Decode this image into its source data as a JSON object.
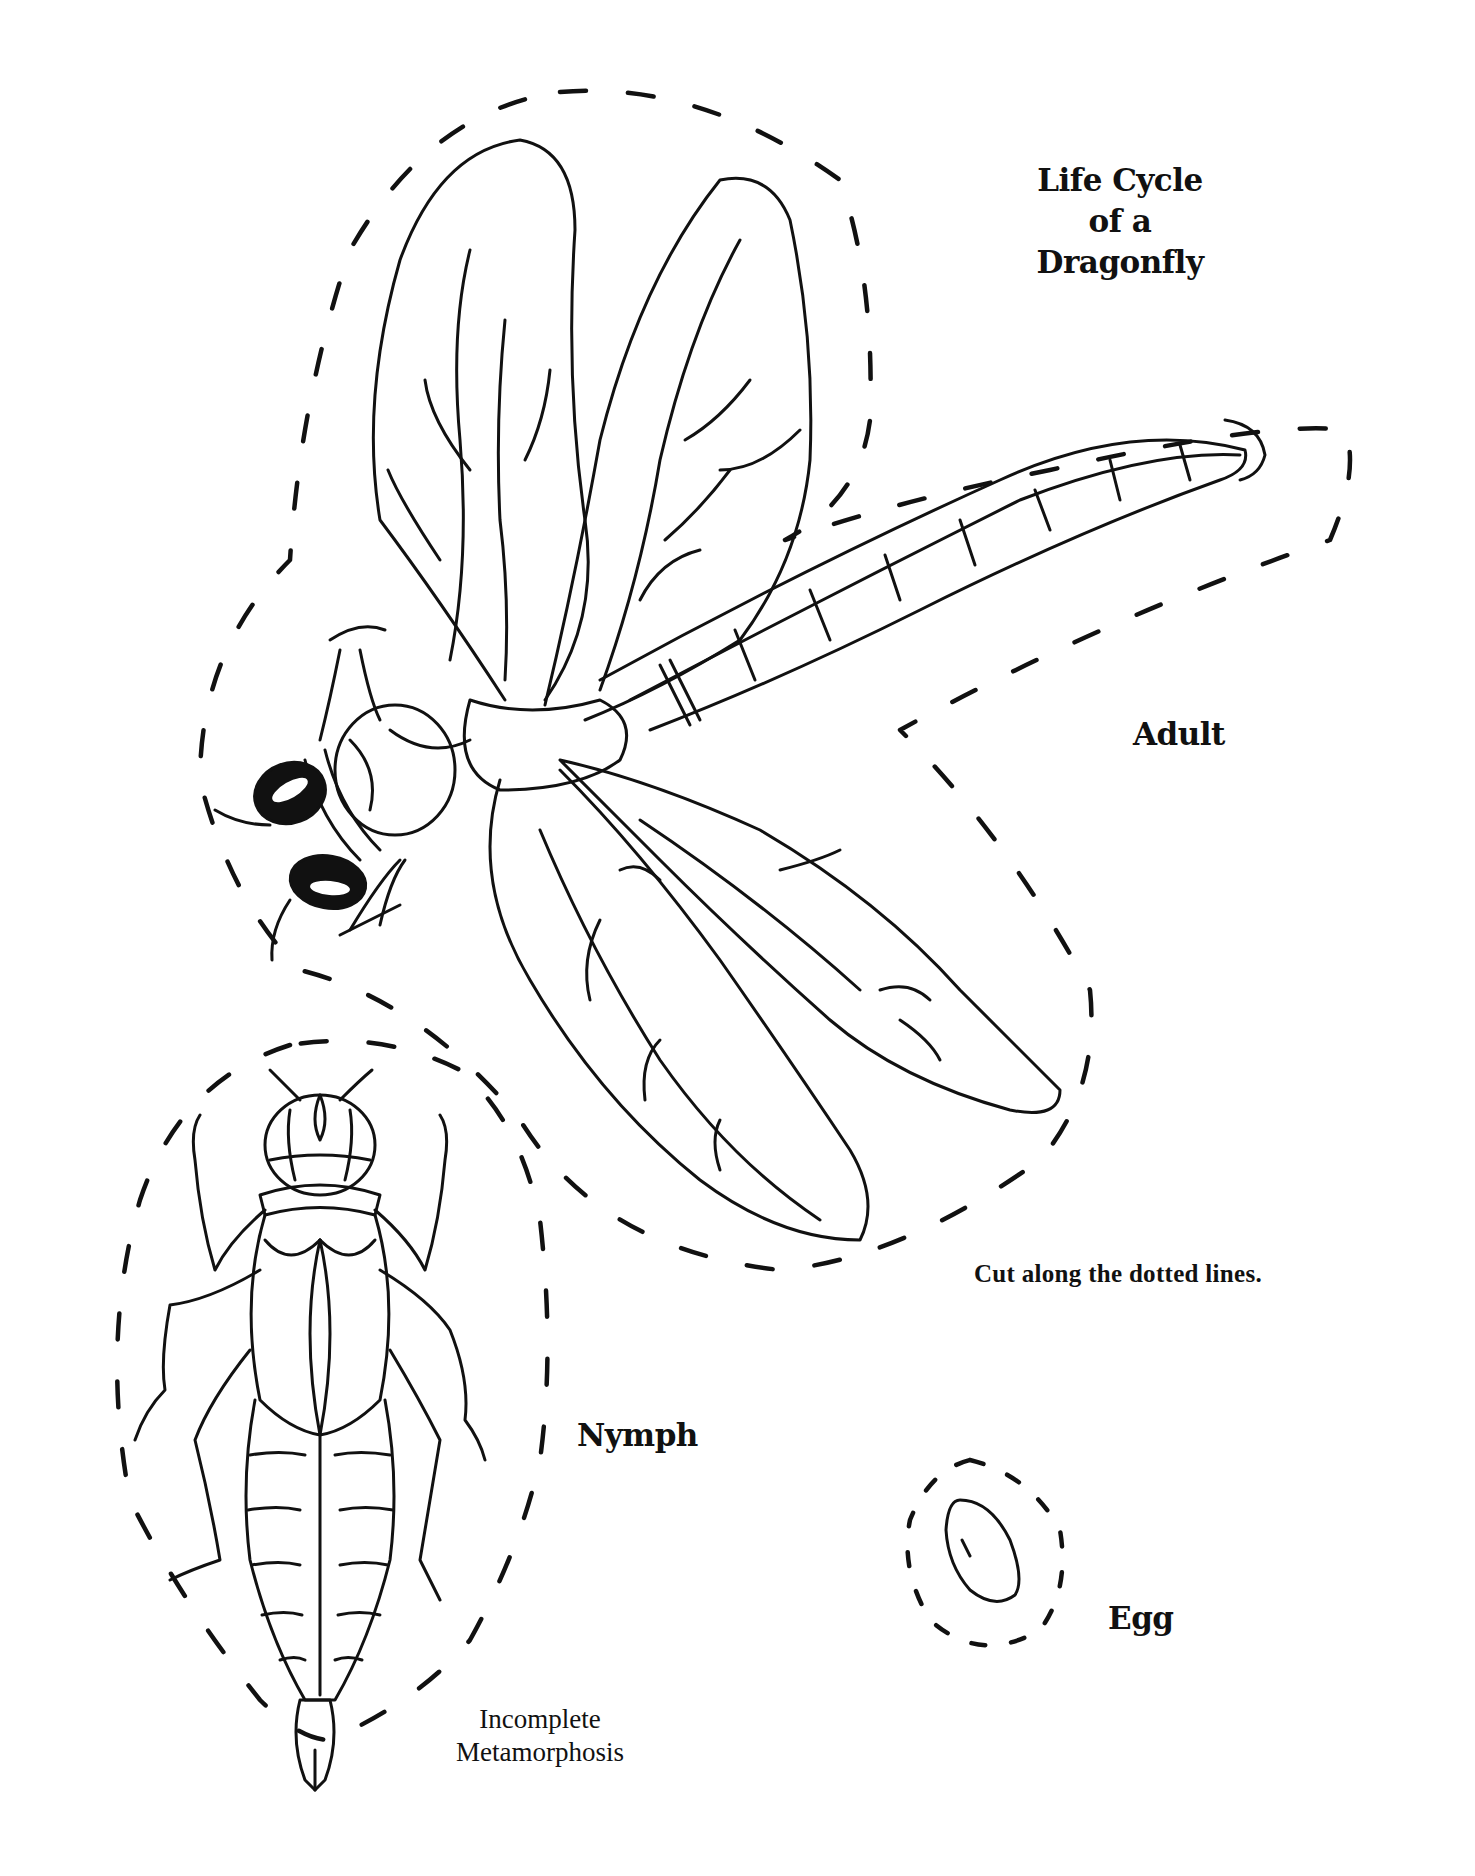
{
  "worksheet": {
    "title_lines": [
      "Life Cycle",
      "of a",
      "Dragonfly"
    ],
    "instruction": "Cut along the dotted lines.",
    "caption_lines": [
      "Incomplete",
      "Metamorphosis"
    ],
    "stages": [
      {
        "id": "adult",
        "label": "Adult"
      },
      {
        "id": "nymph",
        "label": "Nymph"
      },
      {
        "id": "egg",
        "label": "Egg"
      }
    ],
    "colors": {
      "ink": "#111111",
      "paper": "#ffffff"
    }
  }
}
